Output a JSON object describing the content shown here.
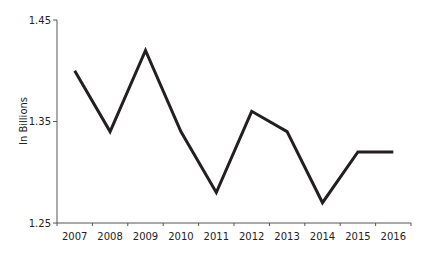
{
  "chart_data": {
    "type": "line",
    "title": "",
    "xlabel": "",
    "ylabel": "In Billions",
    "categories": [
      "2007",
      "2008",
      "2009",
      "2010",
      "2011",
      "2012",
      "2013",
      "2014",
      "2015",
      "2016"
    ],
    "series": [
      {
        "name": "Value",
        "values": [
          1.4,
          1.34,
          1.42,
          1.34,
          1.28,
          1.36,
          1.34,
          1.27,
          1.32,
          1.32
        ],
        "color": "#231f20"
      }
    ],
    "ylim": [
      1.25,
      1.45
    ],
    "yticks": [
      "1.25",
      "1.35",
      "1.45"
    ],
    "grid": false,
    "legend": "none"
  }
}
